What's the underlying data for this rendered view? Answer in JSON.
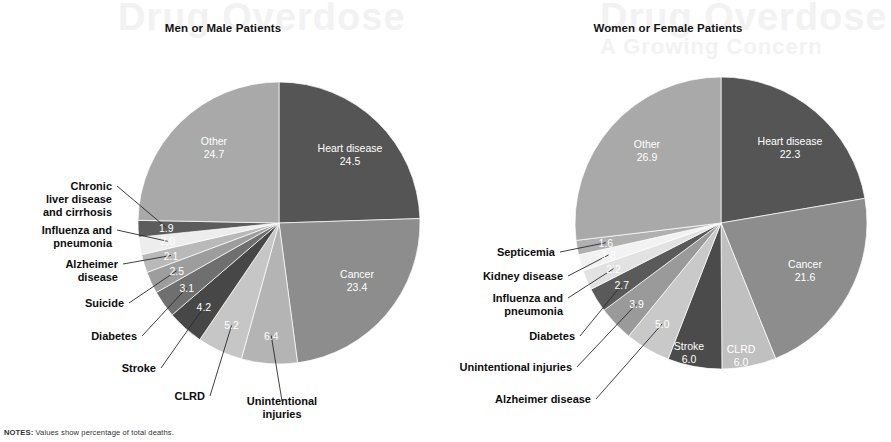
{
  "figure": {
    "notes_prefix": "NOTES:",
    "notes_text": "Values show percentage of total deaths.",
    "background": "#ffffff",
    "watermark": {
      "line1": "Drug Overdose",
      "line2": "Drug Overdose",
      "line3": "A Growing Concern"
    }
  },
  "charts": [
    {
      "id": "male",
      "title": "Men or Male Patients",
      "center": {
        "x": 279,
        "y": 223
      },
      "radius": 141,
      "start_angle_deg": 0
    },
    {
      "id": "female",
      "title": "Women or Female Patients",
      "center": {
        "x": 276,
        "y": 223
      },
      "radius": 146,
      "start_angle_deg": 0
    }
  ],
  "chart_data": [
    {
      "type": "pie",
      "title": "Men or Male Patients",
      "subtitle": "",
      "unit": "percent of total deaths",
      "note": "Values show percentage of total deaths.",
      "labels": [
        "Heart disease",
        "Cancer",
        "Unintentional injuries",
        "CLRD",
        "Stroke",
        "Diabetes",
        "Suicide",
        "Alzheimer disease",
        "Influenza and pneumonia",
        "Chronic liver disease and cirrhosis",
        "Other"
      ],
      "values": [
        24.5,
        23.4,
        6.4,
        5.2,
        4.2,
        3.1,
        2.5,
        2.1,
        2.0,
        1.9,
        24.7
      ],
      "colors": [
        "#555555",
        "#8d8d8d",
        "#b4b4b4",
        "#c6c6c6",
        "#474747",
        "#6f6f6f",
        "#9d9d9d",
        "#b9b9b9",
        "#ededed",
        "#5c5c5c",
        "#a9a9a9"
      ],
      "label_placement": [
        "inside",
        "inside",
        "outside",
        "outside",
        "outside",
        "outside",
        "outside",
        "outside",
        "outside",
        "outside",
        "inside"
      ],
      "legend": "none",
      "grid": false
    },
    {
      "type": "pie",
      "title": "Women or Female Patients",
      "subtitle": "",
      "unit": "percent of total deaths",
      "note": "Values show percentage of total deaths.",
      "labels": [
        "Heart disease",
        "Cancer",
        "CLRD",
        "Stroke",
        "Alzheimer disease",
        "Unintentional injuries",
        "Diabetes",
        "Influenza and pneumonia",
        "Kidney disease",
        "Septicemia",
        "Other"
      ],
      "values": [
        22.3,
        21.6,
        6.0,
        6.0,
        5.0,
        3.9,
        2.7,
        2.2,
        1.8,
        1.6,
        26.9
      ],
      "colors": [
        "#555555",
        "#8d8d8d",
        "#c0c0c0",
        "#4b4b4b",
        "#c9c9c9",
        "#9a9a9a",
        "#5a5a5a",
        "#e2e2e2",
        "#f2f2f2",
        "#b0b0b0",
        "#a9a9a9"
      ],
      "label_placement": [
        "inside",
        "inside",
        "inside",
        "inside",
        "outside",
        "outside",
        "outside",
        "outside",
        "outside",
        "outside",
        "inside"
      ],
      "legend": "none",
      "grid": false
    }
  ],
  "outside_labels": {
    "male": [
      {
        "name": "Chronic liver disease and cirrhosis",
        "lines": [
          "Chronic",
          "liver disease",
          "and cirrhosis"
        ],
        "value": "1.9",
        "x": 112,
        "y": 190,
        "anchor": "end"
      },
      {
        "name": "Influenza and pneumonia",
        "lines": [
          "Influenza and",
          "pneumonia"
        ],
        "value": "2.0",
        "x": 112,
        "y": 234,
        "anchor": "end"
      },
      {
        "name": "Alzheimer disease",
        "lines": [
          "Alzheimer",
          "disease"
        ],
        "value": "2.1",
        "x": 118,
        "y": 268,
        "anchor": "end"
      },
      {
        "name": "Suicide",
        "lines": [
          "Suicide"
        ],
        "value": "2.5",
        "x": 124,
        "y": 307,
        "anchor": "end"
      },
      {
        "name": "Diabetes",
        "lines": [
          "Diabetes"
        ],
        "value": "3.1",
        "x": 137,
        "y": 340,
        "anchor": "end"
      },
      {
        "name": "Stroke",
        "lines": [
          "Stroke"
        ],
        "value": "4.2",
        "x": 156,
        "y": 372,
        "anchor": "end"
      },
      {
        "name": "CLRD",
        "lines": [
          "CLRD"
        ],
        "value": "5.2",
        "x": 205,
        "y": 400,
        "anchor": "end"
      },
      {
        "name": "Unintentional injuries",
        "lines": [
          "Unintentional",
          "injuries"
        ],
        "value": "6.4",
        "x": 282,
        "y": 405,
        "anchor": "middle"
      }
    ],
    "female": [
      {
        "name": "Septicemia",
        "lines": [
          "Septicemia"
        ],
        "value": "1.6",
        "x": 110,
        "y": 256,
        "anchor": "end"
      },
      {
        "name": "Kidney disease",
        "lines": [
          "Kidney disease"
        ],
        "value": "1.8",
        "x": 118,
        "y": 280,
        "anchor": "end"
      },
      {
        "name": "Influenza and pneumonia",
        "lines": [
          "Influenza and",
          "pneumonia"
        ],
        "value": "2.2",
        "x": 118,
        "y": 302,
        "anchor": "end"
      },
      {
        "name": "Diabetes",
        "lines": [
          "Diabetes"
        ],
        "value": "2.7",
        "x": 130,
        "y": 340,
        "anchor": "end"
      },
      {
        "name": "Unintentional injuries",
        "lines": [
          "Unintentional injuries"
        ],
        "value": "3.9",
        "x": 127,
        "y": 371,
        "anchor": "end"
      },
      {
        "name": "Alzheimer disease",
        "lines": [
          "Alzheimer disease"
        ],
        "value": "5.0",
        "x": 146,
        "y": 403,
        "anchor": "end"
      }
    ]
  },
  "inside_labels": {
    "male": [
      {
        "name": "Heart disease",
        "lines": [
          "Heart disease",
          "24.5"
        ],
        "x": 350,
        "y": 152
      },
      {
        "name": "Cancer",
        "lines": [
          "Cancer",
          "23.4"
        ],
        "x": 357,
        "y": 278
      },
      {
        "name": "Other",
        "lines": [
          "Other",
          "24.7"
        ],
        "x": 214,
        "y": 145
      }
    ],
    "female": [
      {
        "name": "Heart disease",
        "lines": [
          "Heart disease",
          "22.3"
        ],
        "x": 345,
        "y": 145
      },
      {
        "name": "Cancer",
        "lines": [
          "Cancer",
          "21.6"
        ],
        "x": 360,
        "y": 268
      },
      {
        "name": "Other",
        "lines": [
          "Other",
          "26.9"
        ],
        "x": 202,
        "y": 148
      },
      {
        "name": "Stroke",
        "lines": [
          "Stroke",
          "6.0"
        ],
        "x": 244,
        "y": 350
      },
      {
        "name": "CLRD",
        "lines": [
          "CLRD",
          "6.0"
        ],
        "x": 296,
        "y": 353
      }
    ]
  }
}
